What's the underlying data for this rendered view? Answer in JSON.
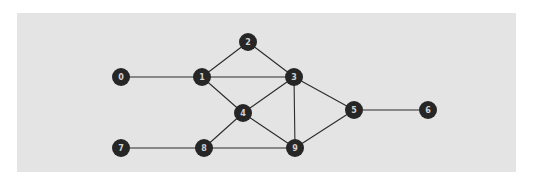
{
  "figure": {
    "title": "",
    "background_color": "#ffffff",
    "panel": {
      "x": 17,
      "y": 13,
      "width": 499,
      "height": 159,
      "fill_color": "#e4e4e4"
    }
  },
  "chart_data": {
    "type": "diagram",
    "diagram_kind": "node-link-graph",
    "directed": false,
    "title": "",
    "node_count": 10,
    "edge_count": 14,
    "style": {
      "node_fill": "#262626",
      "node_label_color": "#d2d2d2",
      "node_radius": 9,
      "node_label_font_size": 8,
      "edge_color": "#2b2b2b",
      "edge_width": 1.1
    },
    "nodes": [
      {
        "id": "0",
        "label": "0",
        "x": 121,
        "y": 77
      },
      {
        "id": "1",
        "label": "1",
        "x": 202,
        "y": 77
      },
      {
        "id": "2",
        "label": "2",
        "x": 248,
        "y": 42
      },
      {
        "id": "3",
        "label": "3",
        "x": 294,
        "y": 77
      },
      {
        "id": "4",
        "label": "4",
        "x": 243,
        "y": 113
      },
      {
        "id": "5",
        "label": "5",
        "x": 354,
        "y": 110
      },
      {
        "id": "6",
        "label": "6",
        "x": 428,
        "y": 110
      },
      {
        "id": "7",
        "label": "7",
        "x": 121,
        "y": 148
      },
      {
        "id": "8",
        "label": "8",
        "x": 204,
        "y": 148
      },
      {
        "id": "9",
        "label": "9",
        "x": 295,
        "y": 148
      }
    ],
    "edges": [
      {
        "source": "0",
        "target": "1"
      },
      {
        "source": "1",
        "target": "2"
      },
      {
        "source": "1",
        "target": "3"
      },
      {
        "source": "1",
        "target": "4"
      },
      {
        "source": "2",
        "target": "3"
      },
      {
        "source": "3",
        "target": "4"
      },
      {
        "source": "3",
        "target": "9"
      },
      {
        "source": "3",
        "target": "5"
      },
      {
        "source": "4",
        "target": "8"
      },
      {
        "source": "4",
        "target": "9"
      },
      {
        "source": "5",
        "target": "6"
      },
      {
        "source": "5",
        "target": "9"
      },
      {
        "source": "7",
        "target": "8"
      },
      {
        "source": "8",
        "target": "9"
      }
    ],
    "adjacency": {
      "0": [
        "1"
      ],
      "1": [
        "0",
        "2",
        "3",
        "4"
      ],
      "2": [
        "1",
        "3"
      ],
      "3": [
        "1",
        "2",
        "4",
        "5",
        "9"
      ],
      "4": [
        "1",
        "3",
        "8",
        "9"
      ],
      "5": [
        "3",
        "6",
        "9"
      ],
      "6": [
        "5"
      ],
      "7": [
        "8"
      ],
      "8": [
        "4",
        "7",
        "9"
      ],
      "9": [
        "3",
        "4",
        "5",
        "8"
      ]
    },
    "degrees": {
      "0": 1,
      "1": 4,
      "2": 2,
      "3": 5,
      "4": 4,
      "5": 3,
      "6": 1,
      "7": 1,
      "8": 3,
      "9": 4
    }
  }
}
